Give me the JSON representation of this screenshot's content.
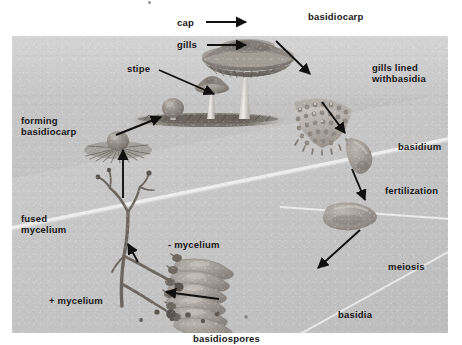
{
  "figure": {
    "background_color": "#ffffff",
    "plate_color": "#c6c6c6",
    "label_color": "#171717"
  },
  "labels": {
    "cap": "cap",
    "gills": "gills",
    "stipe": "stipe",
    "basidiocarp": "basidiocarp",
    "gills_lined_1": "gills lined",
    "gills_lined_2": "withbasidia",
    "basidium": "basidium",
    "fertilization": "fertilization",
    "meiosis": "meiosis",
    "basidia": "basidia",
    "basidiospores": "basidiospores",
    "plus_mycelium": "+ mycelium",
    "minus_mycelium": "- mycelium",
    "fused_mycelium_1": "fused",
    "fused_mycelium_2": "mycelium",
    "forming_basidiocarp_1": "forming",
    "forming_basidiocarp_2": "basidiocarp"
  },
  "label_positions": [
    {
      "name": "cap",
      "x": 177,
      "y": 17
    },
    {
      "name": "gills",
      "x": 177,
      "y": 39
    },
    {
      "name": "stipe",
      "x": 127,
      "y": 63
    },
    {
      "name": "basidiocarp",
      "x": 308,
      "y": 11
    },
    {
      "name": "gills-lined-with-basidia",
      "x": 372,
      "y": 63
    },
    {
      "name": "basidium",
      "x": 398,
      "y": 141
    },
    {
      "name": "fertilization",
      "x": 385,
      "y": 185
    },
    {
      "name": "meiosis",
      "x": 388,
      "y": 261
    },
    {
      "name": "basidia",
      "x": 338,
      "y": 309
    },
    {
      "name": "basidiospores",
      "x": 193,
      "y": 333
    },
    {
      "name": "plus-mycelium",
      "x": 49,
      "y": 295
    },
    {
      "name": "minus-mycelium",
      "x": 168,
      "y": 239
    },
    {
      "name": "fused-mycelium",
      "x": 21,
      "y": 214
    },
    {
      "name": "forming-basidiocarp",
      "x": 21,
      "y": 116
    }
  ],
  "arrows": [
    {
      "name": "cap-pointer",
      "x1": 205,
      "y1": 22,
      "x2": 243,
      "y2": 22,
      "style": "leader"
    },
    {
      "name": "gills-pointer",
      "x1": 206,
      "y1": 45,
      "x2": 243,
      "y2": 45,
      "style": "leader"
    },
    {
      "name": "stipe-pointer",
      "x1": 158,
      "y1": 70,
      "x2": 213,
      "y2": 93,
      "style": "leader"
    },
    {
      "name": "basidiocarp-to-gill-section",
      "x1": 277,
      "y1": 42,
      "x2": 308,
      "y2": 72,
      "style": "cycle"
    },
    {
      "name": "gill-section-to-basidium",
      "x1": 325,
      "y1": 104,
      "x2": 343,
      "y2": 130,
      "style": "cycle"
    },
    {
      "name": "basidium-to-fertilization",
      "x1": 353,
      "y1": 169,
      "x2": 363,
      "y2": 198,
      "style": "cycle"
    },
    {
      "name": "fertilization-to-basidia",
      "x1": 358,
      "y1": 228,
      "x2": 320,
      "y2": 266,
      "style": "cycle"
    },
    {
      "name": "basidiospores-to-mycelium",
      "x1": 217,
      "y1": 298,
      "x2": 167,
      "y2": 292,
      "style": "cycle"
    },
    {
      "name": "mycelium-to-forming",
      "x1": 137,
      "y1": 258,
      "x2": 131,
      "y2": 236,
      "style": "cycle-short"
    },
    {
      "name": "fused-to-forming",
      "x1": 123,
      "y1": 198,
      "x2": 123,
      "y2": 148,
      "style": "cycle"
    },
    {
      "name": "forming-to-mature",
      "x1": 117,
      "y1": 133,
      "x2": 160,
      "y2": 117,
      "style": "cycle"
    }
  ],
  "structures": [
    {
      "name": "mature-mushroom",
      "description": "large basidiocarp with cap, gills and stipe"
    },
    {
      "name": "small-mushroom",
      "description": "medium developing basidiocarp"
    },
    {
      "name": "button-mushroom",
      "description": "young button stage basidiocarp"
    },
    {
      "name": "gill-section",
      "description": "wedge of gill tissue lined with basidia"
    },
    {
      "name": "basidium-cell",
      "description": "single club-shaped basidium"
    },
    {
      "name": "zygote-cell",
      "description": "diploid basidium after fertilization"
    },
    {
      "name": "basidia-cluster",
      "description": "cluster of basidia bearing basidiospores"
    },
    {
      "name": "spore-dots",
      "description": "scattered basidiospores"
    },
    {
      "name": "mycelium-network",
      "description": "branching fused mycelium hyphae"
    },
    {
      "name": "forming-basidiocarp-tuft",
      "description": "mycelial tuft with emerging button"
    }
  ]
}
